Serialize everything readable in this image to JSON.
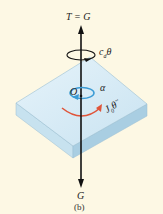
{
  "figure": {
    "caption": "(b)",
    "labels": {
      "top_force": "T = G",
      "damping_torque": "c_dθ",
      "damping_torque_main": "c",
      "damping_torque_sub": "d",
      "damping_torque_var": "θ",
      "origin": "O",
      "angular_accel": "α",
      "inertia_torque_main": "J",
      "inertia_torque_sub": "0",
      "inertia_torque_var": "θ̈",
      "bottom_force": "G"
    },
    "colors": {
      "background": "#fdf8e4",
      "plate_top": "#dbeef7",
      "plate_side_left": "#c4e0ee",
      "plate_side_right": "#a9cfe3",
      "alpha_arrow": "#3a9bd5",
      "inertia_arrow": "#e0553a",
      "axis": "#111111"
    }
  }
}
